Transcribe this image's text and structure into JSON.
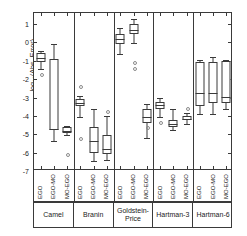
{
  "chart_data": {
    "type": "boxplot",
    "title": "",
    "xlabel": "",
    "ylabel": "log10(Abs. Error)",
    "ylabel_parts": {
      "prefix": "log",
      "sub": "10",
      "suffix": "(Abs. Error)"
    },
    "ylim": [
      -7,
      1.6
    ],
    "yticks": [
      1,
      0,
      -1,
      -2,
      -3,
      -4,
      -5,
      -6,
      -7
    ],
    "ytick_labels": [
      "1",
      "0",
      "-1",
      "-2",
      "-3",
      "-4",
      "-5",
      "-6",
      "-7"
    ],
    "grid": false,
    "legend": "none",
    "groups": [
      "Camel",
      "Branin",
      "Goldstein-Price",
      "Hartman-3",
      "Hartman-6"
    ],
    "series": [
      "EGO",
      "EGO-MO",
      "MO-EGO"
    ],
    "boxes": [
      {
        "group": "Camel",
        "series": "EGO",
        "whisker_low": -1.45,
        "q1": -1.05,
        "median": -0.85,
        "q3": -0.6,
        "whisker_high": -0.45,
        "outliers": [
          -1.72
        ]
      },
      {
        "group": "Camel",
        "series": "EGO-MO",
        "whisker_low": -5.35,
        "q1": -4.75,
        "median": -4.7,
        "q3": -0.92,
        "whisker_high": -0.1,
        "outliers": []
      },
      {
        "group": "Camel",
        "series": "MO-EGO",
        "whisker_low": -5.05,
        "q1": -4.95,
        "median": -4.8,
        "q3": -4.62,
        "whisker_high": -4.55,
        "outliers": [
          -6.1
        ]
      },
      {
        "group": "Branin",
        "series": "EGO",
        "whisker_low": -4.05,
        "q1": -3.48,
        "median": -3.28,
        "q3": -3.1,
        "whisker_high": -2.92,
        "outliers": [
          -2.35,
          -5.2
        ]
      },
      {
        "group": "Branin",
        "series": "EGO-MO",
        "whisker_low": -6.45,
        "q1": -6.0,
        "median": -5.38,
        "q3": -4.58,
        "whisker_high": -3.62,
        "outliers": []
      },
      {
        "group": "Branin",
        "series": "MO-EGO",
        "whisker_low": -6.4,
        "q1": -6.05,
        "median": -5.8,
        "q3": -5.02,
        "whisker_high": -4.02,
        "outliers": [
          -3.72
        ]
      },
      {
        "group": "Goldstein-Price",
        "series": "EGO",
        "whisker_low": -0.62,
        "q1": -0.08,
        "median": 0.18,
        "q3": 0.48,
        "whisker_high": 0.78,
        "outliers": []
      },
      {
        "group": "Goldstein-Price",
        "series": "EGO-MO",
        "whisker_low": -0.05,
        "q1": 0.45,
        "median": 0.68,
        "q3": 0.98,
        "whisker_high": 1.28,
        "outliers": [
          -1.08,
          -1.38
        ]
      },
      {
        "group": "Goldstein-Price",
        "series": "MO-EGO",
        "whisker_low": -5.2,
        "q1": -4.38,
        "median": -4.05,
        "q3": -3.62,
        "whisker_high": -3.35,
        "outliers": [
          -4.62
        ]
      },
      {
        "group": "Hartman-3",
        "series": "EGO",
        "whisker_low": -4.05,
        "q1": -3.6,
        "median": -3.42,
        "q3": -3.22,
        "whisker_high": -3.05,
        "outliers": [
          -4.35
        ]
      },
      {
        "group": "Hartman-3",
        "series": "EGO-MO",
        "whisker_low": -4.78,
        "q1": -4.58,
        "median": -4.42,
        "q3": -4.25,
        "whisker_high": -3.62,
        "outliers": []
      },
      {
        "group": "Hartman-3",
        "series": "MO-EGO",
        "whisker_low": -4.42,
        "q1": -4.25,
        "median": -4.18,
        "q3": -4.0,
        "whisker_high": -3.85,
        "outliers": [
          -3.55
        ]
      },
      {
        "group": "Hartman-6",
        "series": "EGO",
        "whisker_low": -3.92,
        "q1": -3.45,
        "median": -2.78,
        "q3": -1.05,
        "whisker_high": -0.98,
        "outliers": []
      },
      {
        "group": "Hartman-6",
        "series": "EGO-MO",
        "whisker_low": -3.88,
        "q1": -3.28,
        "median": -2.78,
        "q3": -1.08,
        "whisker_high": -0.82,
        "outliers": []
      },
      {
        "group": "Hartman-6",
        "series": "MO-EGO",
        "whisker_low": -3.62,
        "q1": -3.32,
        "median": -2.95,
        "q3": -1.02,
        "whisker_high": -0.95,
        "outliers": []
      }
    ]
  },
  "style": {
    "line_color": "#3a3a3a",
    "box_fill": "#ffffff",
    "outlier_color": "#8a8a8a",
    "background": "#ffffff"
  }
}
